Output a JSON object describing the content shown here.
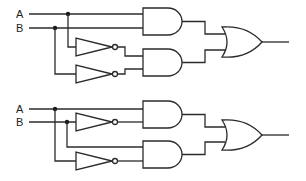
{
  "diagram": {
    "type": "logic-circuit",
    "circuits": [
      {
        "id": "top",
        "inputs": [
          {
            "label": "A"
          },
          {
            "label": "B"
          }
        ],
        "gates": [
          {
            "type": "AND",
            "inputs": [
              "A",
              "B"
            ]
          },
          {
            "type": "NOT",
            "input": "A"
          },
          {
            "type": "NOT",
            "input": "B"
          },
          {
            "type": "AND",
            "inputs": [
              "NOT A",
              "NOT B"
            ]
          },
          {
            "type": "OR",
            "inputs": [
              "AND(A,B)",
              "AND(NOT A, NOT B)"
            ]
          }
        ],
        "expression": "A·B + A'·B'"
      },
      {
        "id": "bottom",
        "inputs": [
          {
            "label": "A"
          },
          {
            "label": "B"
          }
        ],
        "gates": [
          {
            "type": "NOT",
            "input": "B"
          },
          {
            "type": "AND",
            "inputs": [
              "A",
              "NOT B"
            ]
          },
          {
            "type": "NOT",
            "input": "A"
          },
          {
            "type": "AND",
            "inputs": [
              "B",
              "NOT A"
            ]
          },
          {
            "type": "OR",
            "inputs": [
              "AND(A,B')",
              "AND(A',B)"
            ]
          }
        ],
        "expression": "A·B' + A'·B"
      }
    ]
  },
  "colors": {
    "stroke": "#2b2b2b",
    "background": "#ffffff"
  }
}
